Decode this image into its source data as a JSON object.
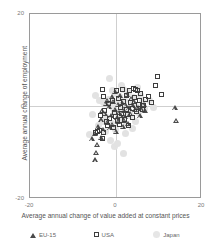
{
  "chart_data": {
    "type": "scatter",
    "title": "",
    "xlabel": "Average annual change of value added at constant prices",
    "ylabel": "Average annual change of employment",
    "xlim": [
      -20,
      20
    ],
    "ylim": [
      -20,
      20
    ],
    "xticks": [
      -20,
      0,
      20
    ],
    "yticks": [
      -20,
      0,
      20
    ],
    "xtick_labels": [
      "-20",
      "0",
      "20"
    ],
    "ytick_labels": [
      "-20",
      "0",
      "20"
    ],
    "grid": true,
    "legend_position": "bottom",
    "series": [
      {
        "name": "Japan",
        "marker": "circle",
        "color": "#e2e2e2",
        "points": [
          [
            -0.6,
            3.2
          ],
          [
            1.0,
            2.0
          ],
          [
            2.2,
            1.2
          ],
          [
            0.4,
            0.6
          ],
          [
            -1.2,
            0.2
          ],
          [
            1.8,
            -0.4
          ],
          [
            3.0,
            -0.8
          ],
          [
            -0.2,
            -1.4
          ],
          [
            0.8,
            -2.0
          ],
          [
            2.6,
            -1.0
          ],
          [
            4.0,
            0.4
          ],
          [
            -2.0,
            -2.6
          ],
          [
            -3.0,
            -3.6
          ],
          [
            1.4,
            -3.0
          ],
          [
            3.6,
            -2.2
          ],
          [
            5.0,
            -0.2
          ],
          [
            -1.6,
            1.4
          ],
          [
            0.2,
            2.6
          ],
          [
            2.0,
            3.4
          ],
          [
            4.4,
            1.8
          ],
          [
            -4.0,
            -4.4
          ],
          [
            -0.8,
            -4.0
          ],
          [
            2.8,
            -4.2
          ],
          [
            5.6,
            -1.6
          ],
          [
            6.4,
            0.8
          ],
          [
            -2.6,
            0.6
          ],
          [
            -0.4,
            -0.6
          ],
          [
            1.2,
            -1.2
          ],
          [
            3.4,
            -1.8
          ],
          [
            0.0,
            -5.2
          ],
          [
            -1.0,
            -7.6
          ],
          [
            2.4,
            -6.2
          ],
          [
            4.8,
            -3.4
          ],
          [
            -5.2,
            -2.0
          ],
          [
            7.0,
            -0.6
          ],
          [
            -3.6,
            1.0
          ],
          [
            1.6,
            4.4
          ],
          [
            3.2,
            2.8
          ],
          [
            -0.2,
            -9.0
          ],
          [
            6.0,
            2.2
          ],
          [
            -2.2,
            -5.6
          ],
          [
            0.6,
            -8.2
          ],
          [
            4.2,
            -5.0
          ],
          [
            -6.0,
            -6.4
          ],
          [
            8.0,
            1.0
          ],
          [
            -1.4,
            6.0
          ],
          [
            5.2,
            4.0
          ],
          [
            -4.6,
            2.2
          ],
          [
            2.0,
            -10.4
          ],
          [
            9.0,
            -0.4
          ]
        ]
      },
      {
        "name": "EU-15",
        "marker": "triangle",
        "color": "#4a4a4a",
        "points": [
          [
            -0.4,
            0.8
          ],
          [
            0.6,
            0.2
          ],
          [
            1.6,
            0.6
          ],
          [
            2.6,
            0.0
          ],
          [
            -1.4,
            -0.4
          ],
          [
            0.0,
            -1.0
          ],
          [
            1.0,
            -1.6
          ],
          [
            2.0,
            -1.2
          ],
          [
            3.2,
            -0.6
          ],
          [
            4.2,
            -0.2
          ],
          [
            -2.4,
            -1.8
          ],
          [
            -1.0,
            -2.4
          ],
          [
            0.4,
            -2.8
          ],
          [
            1.4,
            -2.2
          ],
          [
            2.4,
            -2.6
          ],
          [
            3.6,
            -1.8
          ],
          [
            4.8,
            -1.0
          ],
          [
            -3.2,
            -3.2
          ],
          [
            -2.0,
            -3.8
          ],
          [
            -0.6,
            -4.2
          ],
          [
            0.8,
            -3.6
          ],
          [
            2.2,
            -3.4
          ],
          [
            3.0,
            -4.0
          ],
          [
            5.4,
            -0.6
          ],
          [
            6.2,
            -0.8
          ],
          [
            -4.0,
            -4.8
          ],
          [
            -2.8,
            -5.4
          ],
          [
            -1.2,
            -5.0
          ],
          [
            0.2,
            -5.8
          ],
          [
            1.8,
            -4.6
          ],
          [
            -4.8,
            -6.2
          ],
          [
            -3.4,
            -7.0
          ],
          [
            -5.4,
            -7.4
          ],
          [
            -4.2,
            -8.6
          ],
          [
            -4.4,
            -10.4
          ],
          [
            -4.6,
            -12.0
          ],
          [
            14.0,
            -0.6
          ],
          [
            14.4,
            -3.4
          ],
          [
            7.0,
            -1.2
          ],
          [
            5.8,
            -2.4
          ],
          [
            -0.8,
            1.8
          ],
          [
            1.2,
            2.0
          ],
          [
            3.8,
            1.4
          ],
          [
            2.8,
            2.4
          ],
          [
            -2.2,
            0.4
          ],
          [
            4.4,
            0.8
          ],
          [
            0.0,
            3.0
          ],
          [
            -1.8,
            1.0
          ],
          [
            6.8,
            0.2
          ],
          [
            -3.0,
            -1.2
          ]
        ]
      },
      {
        "name": "USA",
        "marker": "square",
        "color": "#3d3d3d",
        "points": [
          [
            -3.0,
            3.4
          ],
          [
            0.4,
            3.2
          ],
          [
            1.8,
            3.6
          ],
          [
            3.4,
            3.2
          ],
          [
            4.4,
            3.8
          ],
          [
            4.8,
            3.4
          ],
          [
            5.2,
            3.2
          ],
          [
            2.6,
            2.2
          ],
          [
            6.0,
            2.6
          ],
          [
            7.2,
            1.4
          ],
          [
            0.8,
            1.6
          ],
          [
            -0.6,
            1.2
          ],
          [
            2.0,
            0.8
          ],
          [
            3.6,
            0.6
          ],
          [
            5.6,
            0.2
          ],
          [
            6.8,
            0.0
          ],
          [
            -1.6,
            0.4
          ],
          [
            1.2,
            -0.4
          ],
          [
            2.8,
            -0.8
          ],
          [
            4.2,
            -0.6
          ],
          [
            -2.4,
            -1.0
          ],
          [
            -0.2,
            -1.6
          ],
          [
            1.6,
            -1.8
          ],
          [
            3.0,
            -2.0
          ],
          [
            5.0,
            -1.4
          ],
          [
            -3.4,
            -2.2
          ],
          [
            -1.2,
            -2.8
          ],
          [
            0.6,
            -3.2
          ],
          [
            2.2,
            -3.0
          ],
          [
            4.0,
            -2.6
          ],
          [
            -4.6,
            -5.8
          ],
          [
            -4.2,
            -5.6
          ],
          [
            -3.6,
            -5.4
          ],
          [
            -2.6,
            -6.0
          ],
          [
            -3.0,
            -7.2
          ],
          [
            -1.8,
            -4.4
          ],
          [
            -0.4,
            -4.8
          ],
          [
            1.0,
            -4.2
          ],
          [
            -2.0,
            -3.6
          ],
          [
            10.0,
            6.4
          ],
          [
            9.6,
            4.4
          ],
          [
            11.0,
            2.4
          ],
          [
            7.8,
            2.0
          ],
          [
            8.6,
            0.6
          ],
          [
            -2.8,
            2.0
          ],
          [
            6.4,
            -0.8
          ],
          [
            3.2,
            -4.4
          ],
          [
            0.2,
            -2.4
          ],
          [
            4.6,
            1.8
          ],
          [
            5.8,
            1.2
          ]
        ]
      }
    ]
  },
  "legend": {
    "items": [
      {
        "label": "EU-15",
        "marker": "triangle"
      },
      {
        "label": "USA",
        "marker": "square"
      },
      {
        "label": "Japan",
        "marker": "circle"
      }
    ]
  }
}
